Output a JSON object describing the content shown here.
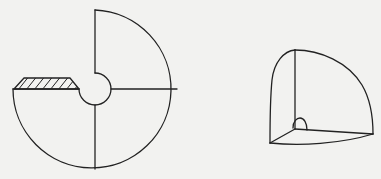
{
  "figures": [
    {
      "id": "left",
      "description": "Three-quarter disc sector (270 degrees) with a small circular cutout at the center, two internal radial lines, and a hatched wedge segment on the left edge",
      "center": [
        95,
        89
      ],
      "outer_radius": 82,
      "inner_radius": 15
    },
    {
      "id": "right",
      "description": "Spherical octant (one-eighth ball) drawn in perspective with three edges meeting at a vertex marked by a small right-angle arc"
    }
  ],
  "colors": {
    "background": "#f2f2f0",
    "line": "#222222"
  }
}
